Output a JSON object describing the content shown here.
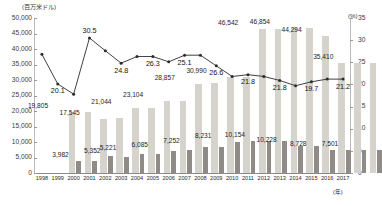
{
  "chart_data": {
    "type": "bar",
    "title": "",
    "xlabel": "(年)",
    "ylabel": "(百万米ドル)",
    "y2label": "(%)",
    "ylim": [
      0,
      50000
    ],
    "y2lim": [
      0,
      35
    ],
    "grid": false,
    "legend_position": "none",
    "categories": [
      "1998",
      "1999",
      "2000",
      "2001",
      "2002",
      "2003",
      "2004",
      "2005",
      "2006",
      "2007",
      "2008",
      "2009",
      "2010",
      "2011",
      "2012",
      "2013",
      "2014",
      "2015",
      "2016",
      "2017"
    ],
    "yticks": [
      "0",
      "5,000",
      "10,000",
      "15,000",
      "20,000",
      "25,000",
      "30,000",
      "35,000",
      "40,000",
      "45,000",
      "50,000"
    ],
    "y2ticks": [
      "0",
      "5",
      "10",
      "15",
      "20",
      "25",
      "30",
      "35"
    ],
    "series": [
      {
        "name": "total",
        "type": "bar",
        "color": "#d6d3cd",
        "axis": "left",
        "values": [
          19805,
          19820,
          17545,
          17600,
          21044,
          21100,
          23104,
          23200,
          28857,
          29000,
          30990,
          31050,
          46542,
          46600,
          46854,
          46900,
          44294,
          35410,
          35450,
          35480
        ],
        "labels": [
          "19,805",
          "",
          "17,545",
          "",
          "21,044",
          "",
          "23,104",
          "",
          "28,857",
          "",
          "30,990",
          "",
          "46,542",
          "",
          "46,854",
          "",
          "44,294",
          "35,410",
          "",
          ""
        ]
      },
      {
        "name": "sub",
        "type": "bar",
        "color": "#8f8c87",
        "axis": "left",
        "values": [
          3982,
          4000,
          5352,
          5221,
          6085,
          6100,
          7252,
          7300,
          8231,
          8300,
          10154,
          10200,
          10228,
          10300,
          8728,
          8800,
          7501,
          7520,
          7540,
          7560
        ],
        "labels": [
          "3,982",
          "",
          "5,352",
          "5,221",
          "6,085",
          "",
          "7,252",
          "",
          "8,231",
          "",
          "10,154",
          "",
          "10,228",
          "",
          "8,728",
          "",
          "7,501",
          "",
          "",
          ""
        ]
      },
      {
        "name": "ratio",
        "type": "line",
        "color": "#2b2b2b",
        "axis": "right",
        "values": [
          26.8,
          20.1,
          17.8,
          30.5,
          27.6,
          24.8,
          26.3,
          26.3,
          25.1,
          26.6,
          26.6,
          24.2,
          21.8,
          22.2,
          21.8,
          20.9,
          19.7,
          20.6,
          21.2,
          21.2
        ],
        "labels": [
          "",
          "20.1",
          "",
          "30.5",
          "",
          "24.8",
          "26.3",
          "",
          "25.1",
          "",
          "26.6",
          "",
          "21.8",
          "",
          "21.8",
          "",
          "19.7",
          "",
          "21.2",
          ""
        ]
      }
    ],
    "bar_labels_left": [
      {
        "text": "19,805",
        "x": 0
      },
      {
        "text": "17,545",
        "x": 2
      },
      {
        "text": "21,044",
        "x": 4
      },
      {
        "text": "23,104",
        "x": 6
      },
      {
        "text": "28,857",
        "x": 8
      },
      {
        "text": "30,990",
        "x": 10
      },
      {
        "text": "46,542",
        "x": 12
      },
      {
        "text": "46,854",
        "x": 14
      },
      {
        "text": "44,294",
        "x": 16
      },
      {
        "text": "35,410",
        "x": 18
      }
    ],
    "bar_labels_dark": [
      {
        "text": "3,982",
        "x": 1
      },
      {
        "text": "5,352",
        "x": 3
      },
      {
        "text": "5,221",
        "x": 4
      },
      {
        "text": "6,085",
        "x": 6
      },
      {
        "text": "7,252",
        "x": 8
      },
      {
        "text": "8,231",
        "x": 10
      },
      {
        "text": "10,154",
        "x": 12
      },
      {
        "text": "10,228",
        "x": 14
      },
      {
        "text": "8,728",
        "x": 16
      },
      {
        "text": "7,501",
        "x": 18
      }
    ],
    "line_labels": [
      {
        "text": "20.1",
        "x": 1
      },
      {
        "text": "30.5",
        "x": 3
      },
      {
        "text": "24.8",
        "x": 5
      },
      {
        "text": "26.3",
        "x": 7
      },
      {
        "text": "25.1",
        "x": 9
      },
      {
        "text": "26.6",
        "x": 11
      },
      {
        "text": "21.8",
        "x": 13
      },
      {
        "text": "21.8",
        "x": 15
      },
      {
        "text": "19.7",
        "x": 17
      },
      {
        "text": "21.2",
        "x": 19
      }
    ]
  }
}
